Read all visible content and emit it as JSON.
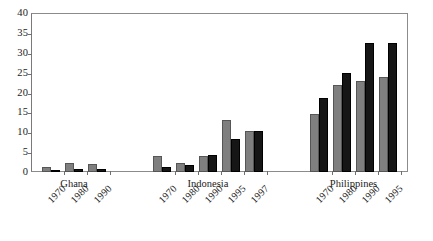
{
  "chart_data": {
    "type": "bar",
    "title": "",
    "subtitle": "",
    "xlabel": "",
    "ylabel": "",
    "ylim": [
      0,
      40
    ],
    "ytick_step": 5,
    "yticks": [
      0,
      5,
      10,
      15,
      20,
      25,
      30,
      35,
      40
    ],
    "ytick_labels": [
      "0",
      "5",
      "10",
      "15",
      "20",
      "25",
      "30",
      "35",
      "40"
    ],
    "grid": false,
    "legend": null,
    "legend_position": "none",
    "orientation": "vertical",
    "grouped": true,
    "series": [
      {
        "name": "series-a",
        "color": "#7f7f7f",
        "values": [
          1.2,
          2.3,
          2.0,
          4.0,
          2.2,
          4.0,
          13.1,
          10.3,
          14.7,
          22.0,
          23.0,
          23.8
        ]
      },
      {
        "name": "series-b",
        "color": "#161616",
        "values": [
          0.3,
          0.7,
          0.8,
          1.3,
          1.8,
          4.2,
          8.2,
          10.4,
          18.5,
          25.0,
          32.5,
          32.5
        ]
      }
    ],
    "categories": [
      "1970",
      "1980",
      "1990",
      "1970",
      "1980",
      "1990",
      "1995",
      "1997",
      "1970",
      "1980",
      "1990",
      "1995"
    ],
    "groups": [
      {
        "label": "Ghana",
        "years": [
          "1970",
          "1980",
          "1990"
        ],
        "series_a": [
          1.2,
          2.3,
          2.0
        ],
        "series_b": [
          0.3,
          0.7,
          0.8
        ]
      },
      {
        "label": "Indonesia",
        "years": [
          "1970",
          "1980",
          "1990",
          "1995",
          "1997"
        ],
        "series_a": [
          4.0,
          2.2,
          4.0,
          13.1,
          10.3
        ],
        "series_b": [
          1.3,
          1.8,
          4.2,
          8.2,
          10.4
        ]
      },
      {
        "label": "Philippines",
        "years": [
          "1970",
          "1980",
          "1990",
          "1995"
        ],
        "series_a": [
          14.7,
          22.0,
          23.0,
          23.8
        ],
        "series_b": [
          18.5,
          25.0,
          32.5,
          32.5
        ]
      }
    ]
  },
  "axis": {
    "frame_color": "#8c8c8c",
    "tick_color": "#6f6f6f"
  }
}
